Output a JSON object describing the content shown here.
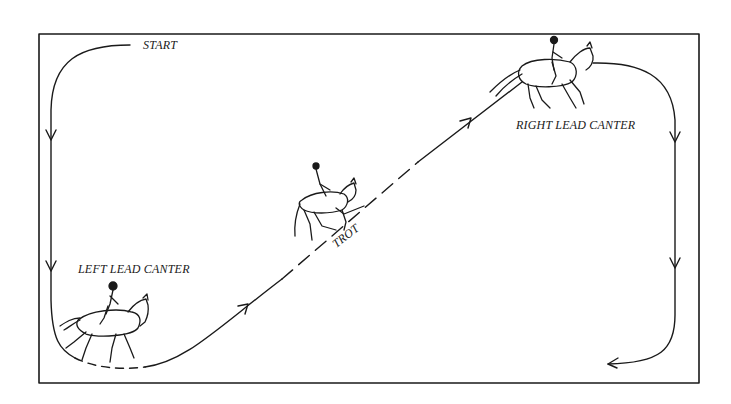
{
  "diagram": {
    "type": "riding-pattern",
    "border_color": "#1a1a1a",
    "ink_color": "#1a1a1a",
    "background": "#ffffff",
    "labels": {
      "start": "START",
      "left_lead_canter": "LEFT LEAD CANTER",
      "trot": "TROT",
      "right_lead_canter": "RIGHT LEAD CANTER"
    },
    "figures": [
      {
        "name": "horse-left-lead-canter",
        "gait": "canter",
        "lead": "left"
      },
      {
        "name": "horse-trot",
        "gait": "trot"
      },
      {
        "name": "horse-right-lead-canter",
        "gait": "canter",
        "lead": "right"
      }
    ],
    "path_sequence": [
      "START",
      "LEFT LEAD CANTER",
      "TROT",
      "RIGHT LEAD CANTER"
    ]
  }
}
